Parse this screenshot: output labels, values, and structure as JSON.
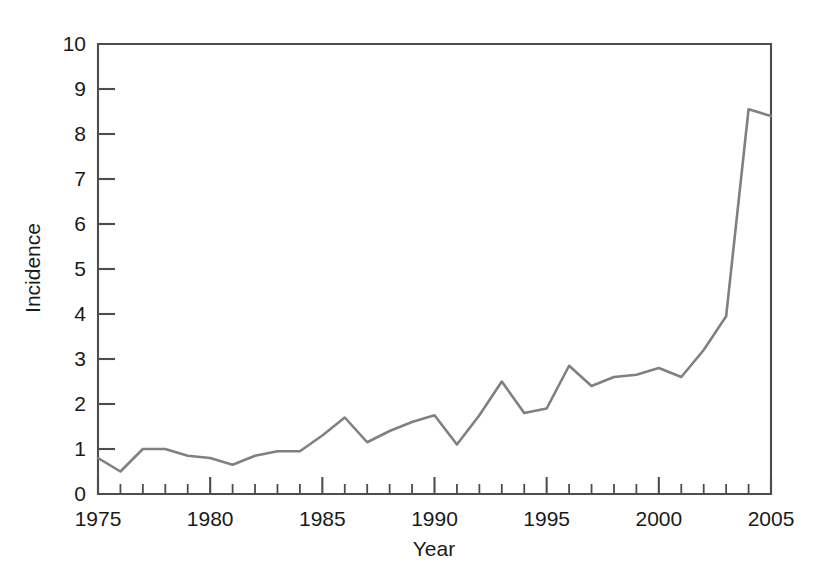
{
  "chart_data": {
    "type": "line",
    "title": "",
    "xlabel": "Year",
    "ylabel": "Incidence",
    "xlim": [
      1975,
      2005
    ],
    "ylim": [
      0,
      10
    ],
    "grid": false,
    "legend": null,
    "line_color": "#808080",
    "axis_color": "#4d4d4d",
    "x_ticks_major": [
      1975,
      1980,
      1985,
      1990,
      1995,
      2000,
      2005
    ],
    "x_tick_labels": [
      "1975",
      "1980",
      "1985",
      "1990",
      "1995",
      "2000",
      "2005"
    ],
    "x_ticks_minor_step": 1,
    "y_ticks": [
      0,
      1,
      2,
      3,
      4,
      5,
      6,
      7,
      8,
      9,
      10
    ],
    "y_tick_labels": [
      "0",
      "1",
      "2",
      "3",
      "4",
      "5",
      "6",
      "7",
      "8",
      "9",
      "10"
    ],
    "x": [
      1975,
      1976,
      1977,
      1978,
      1979,
      1980,
      1981,
      1982,
      1983,
      1984,
      1985,
      1986,
      1987,
      1988,
      1989,
      1990,
      1991,
      1992,
      1993,
      1994,
      1995,
      1996,
      1997,
      1998,
      1999,
      2000,
      2001,
      2002,
      2003,
      2004,
      2005
    ],
    "values": [
      0.8,
      0.5,
      1.0,
      1.0,
      0.85,
      0.8,
      0.65,
      0.85,
      0.95,
      0.95,
      1.3,
      1.7,
      1.15,
      1.4,
      1.6,
      1.75,
      1.1,
      1.75,
      2.5,
      1.8,
      1.9,
      2.85,
      2.4,
      2.6,
      2.65,
      2.8,
      2.6,
      3.2,
      3.95,
      8.55,
      8.4
    ]
  }
}
